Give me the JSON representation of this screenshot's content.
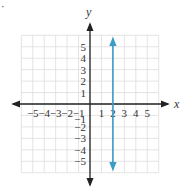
{
  "problem_marker": "·",
  "chart_data": {
    "type": "line",
    "title": "",
    "xlabel": "x",
    "ylabel": "y",
    "xlim": [
      -6,
      6
    ],
    "ylim": [
      -6,
      6
    ],
    "grid": true,
    "x_tick_labels": [
      "−5",
      "−4",
      "−3",
      "−2",
      "−1",
      "1",
      "2",
      "3",
      "4",
      "5"
    ],
    "y_tick_labels": [
      "5",
      "4",
      "3",
      "2",
      "1",
      "−1",
      "−2",
      "−3",
      "−4",
      "−5"
    ],
    "series": [
      {
        "name": "x = 2",
        "description": "vertical line with arrows on both ends",
        "x": [
          2,
          2
        ],
        "y": [
          -5.7,
          5.7
        ],
        "color": "#3a9cc8"
      }
    ],
    "colors": {
      "grid": "#dddddd",
      "axes": "#222222",
      "line": "#3a9cc8"
    }
  }
}
